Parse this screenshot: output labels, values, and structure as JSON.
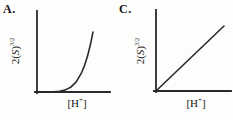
{
  "figure": {
    "background": "#fdfdfc",
    "line_color": "#2a2a2a",
    "text_color": "#161616"
  },
  "panels": [
    {
      "label": "A.",
      "ylabel": {
        "pre": "2(",
        "var": "S",
        "post": ")",
        "sup": "3/2"
      },
      "xlabel": {
        "open": "[H",
        "sup": "+",
        "close": "]"
      }
    },
    {
      "label": "C.",
      "ylabel": {
        "pre": "2(",
        "var": "S",
        "post": ")",
        "sup": "3/2"
      },
      "xlabel": {
        "open": "[H",
        "sup": "+",
        "close": "]"
      }
    }
  ],
  "chart_data": [
    {
      "type": "line",
      "panel": "A.",
      "title": "",
      "xlabel": "[H+]",
      "ylabel": "2(S)^(3/2)",
      "x_axis_ticks": [],
      "y_axis_ticks": [],
      "grid": false,
      "legend": false,
      "curve_shape": "concave-up exponential-style growth from the origin: nearly flat along the x-axis at low [H+], then rising steeply to near-vertical at the right",
      "x_normalized": [
        0,
        0.1,
        0.2,
        0.3,
        0.4,
        0.5,
        0.6,
        0.7,
        0.8,
        0.85,
        0.9,
        0.95,
        1
      ],
      "y_normalized": [
        0,
        0.0001,
        0.0003,
        0.0024,
        0.01,
        0.031,
        0.078,
        0.168,
        0.328,
        0.444,
        0.59,
        0.774,
        1
      ]
    },
    {
      "type": "line",
      "panel": "C.",
      "title": "",
      "xlabel": "[H+]",
      "ylabel": "2(S)^(3/2)",
      "x_axis_ticks": [],
      "y_axis_ticks": [],
      "grid": false,
      "legend": false,
      "curve_shape": "straight line through the origin with constant positive slope",
      "x_normalized": [
        0,
        1
      ],
      "y_normalized": [
        0,
        1
      ]
    }
  ]
}
